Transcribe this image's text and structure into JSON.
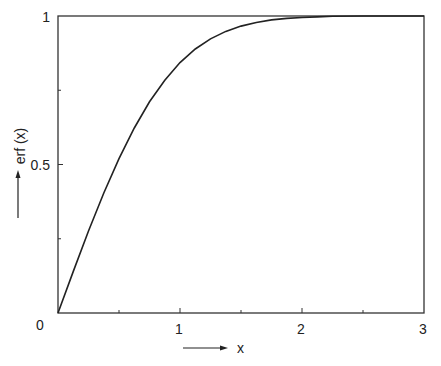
{
  "chart_data": {
    "type": "line",
    "title": "",
    "xlabel": "x",
    "ylabel": "erf (x)",
    "xlim": [
      0,
      3
    ],
    "ylim": [
      0,
      1
    ],
    "grid": false,
    "legend": null,
    "x_ticks": [
      0,
      0.5,
      1,
      1.5,
      2,
      2.5,
      3
    ],
    "x_tick_labels": [
      "0",
      "1",
      "2",
      "3"
    ],
    "y_ticks": [
      0,
      0.25,
      0.5,
      0.75,
      1
    ],
    "y_tick_labels": [
      "0.5",
      "1"
    ],
    "series": [
      {
        "name": "erf(x)",
        "x": [
          0,
          0.125,
          0.25,
          0.375,
          0.5,
          0.625,
          0.75,
          0.875,
          1.0,
          1.125,
          1.25,
          1.375,
          1.5,
          1.625,
          1.75,
          1.875,
          2.0,
          2.125,
          2.25,
          2.5,
          2.75,
          3.0
        ],
        "values": [
          0,
          0.14,
          0.276,
          0.404,
          0.52,
          0.623,
          0.711,
          0.784,
          0.843,
          0.889,
          0.923,
          0.948,
          0.966,
          0.978,
          0.987,
          0.992,
          0.995,
          0.997,
          0.999,
          1.0,
          1.0,
          1.0
        ]
      }
    ],
    "annotations": [
      "arrow beside y-axis label pointing up",
      "arrow beside x-axis label pointing right"
    ]
  },
  "labels": {
    "origin": "0",
    "x_1": "1",
    "x_2": "2",
    "x_3": "3",
    "y_05": "0.5",
    "y_1": "1",
    "xlabel": "x",
    "ylabel": "erf (x)"
  },
  "colors": {
    "line": "#222222",
    "axis": "#333333",
    "background": "#ffffff"
  }
}
